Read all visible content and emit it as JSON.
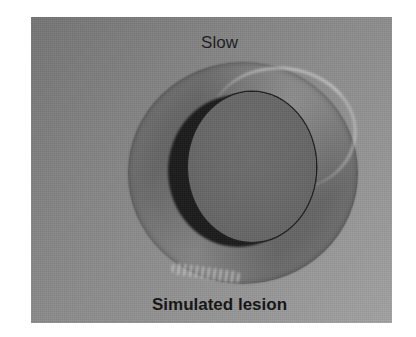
{
  "figure": {
    "top_label": "Slow",
    "bottom_label": "Simulated lesion",
    "colors": {
      "background_dark": "#757575",
      "background_light": "#a2a2a2",
      "ring": "#656565",
      "disc": "#666666",
      "shadow": "#1a1a1a",
      "text": "#111111"
    }
  }
}
